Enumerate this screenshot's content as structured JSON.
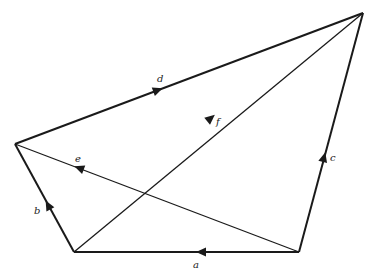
{
  "diagram": {
    "type": "vector-quadrilateral",
    "colors": {
      "line": "#1a1a1a",
      "label": "#222222",
      "background": "#ffffff"
    },
    "points": {
      "BL": [
        74,
        252
      ],
      "BR": [
        299,
        252
      ],
      "L": [
        15,
        144
      ],
      "TR": [
        363,
        13
      ]
    },
    "vectors": [
      {
        "name": "a",
        "from": "BR",
        "to": "BL",
        "label": "a"
      },
      {
        "name": "b",
        "from": "BL",
        "to": "L",
        "label": "b"
      },
      {
        "name": "c",
        "from": "BR",
        "to": "TR",
        "label": "c"
      },
      {
        "name": "d",
        "from": "L",
        "to": "TR",
        "label": "d"
      },
      {
        "name": "e",
        "from": "BR",
        "to": "L",
        "label": "e"
      },
      {
        "name": "f",
        "from": "BL",
        "to": "TR",
        "label": "f"
      }
    ],
    "labels": {
      "a": "a",
      "b": "b",
      "c": "c",
      "d": "d",
      "e": "e",
      "f": "f"
    }
  }
}
